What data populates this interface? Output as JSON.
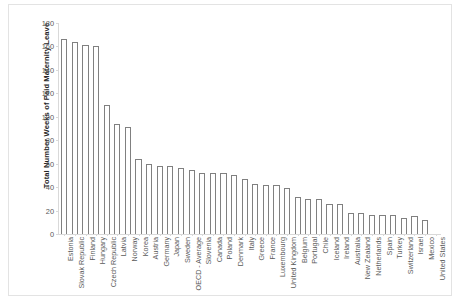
{
  "chart_data": {
    "type": "bar",
    "title": "",
    "xlabel": "",
    "ylabel": "Total Number Weeks of Paid Maternity Leave",
    "ylim": [
      0,
      180
    ],
    "ytick_labels": [
      "180",
      "160",
      "140",
      "120",
      "100",
      "80",
      "60",
      "40",
      "20",
      "0"
    ],
    "ytick_values": [
      180,
      160,
      140,
      120,
      100,
      80,
      60,
      40,
      20,
      0
    ],
    "grid": false,
    "legend": "none",
    "categories": [
      "Estonia",
      "Slovak Republic",
      "Finland",
      "Hungary",
      "Czech Republic",
      "Latvia",
      "Norway",
      "Korea",
      "Austria",
      "Germany",
      "Japan",
      "Sweden",
      "OECD - Average",
      "Slovenia",
      "Canada",
      "Poland",
      "Denmark",
      "Italy",
      "Greece",
      "France",
      "Luxembourg",
      "United Kingdom",
      "Belgium",
      "Portugal",
      "Chile",
      "Iceland",
      "Ireland",
      "Australia",
      "New Zealand",
      "Netherlands",
      "Spain",
      "Turkey",
      "Switzerland",
      "Israel",
      "Mexico",
      "United States"
    ],
    "values": [
      166,
      164,
      161,
      160,
      110,
      94,
      91,
      64,
      60,
      58,
      58,
      56,
      55,
      52,
      52,
      52,
      50,
      47,
      43,
      42,
      42,
      39,
      32,
      30,
      30,
      26,
      26,
      18,
      18,
      16,
      16,
      16,
      14,
      15,
      12,
      0
    ],
    "colors": {
      "bar_fill": "#ffffff",
      "bar_stroke": "#808080",
      "axis": "#d9d9d9",
      "tick_text": "#595959",
      "axis_title": "#262626",
      "frame": "#e3e3e3",
      "background": "#ffffff"
    }
  }
}
